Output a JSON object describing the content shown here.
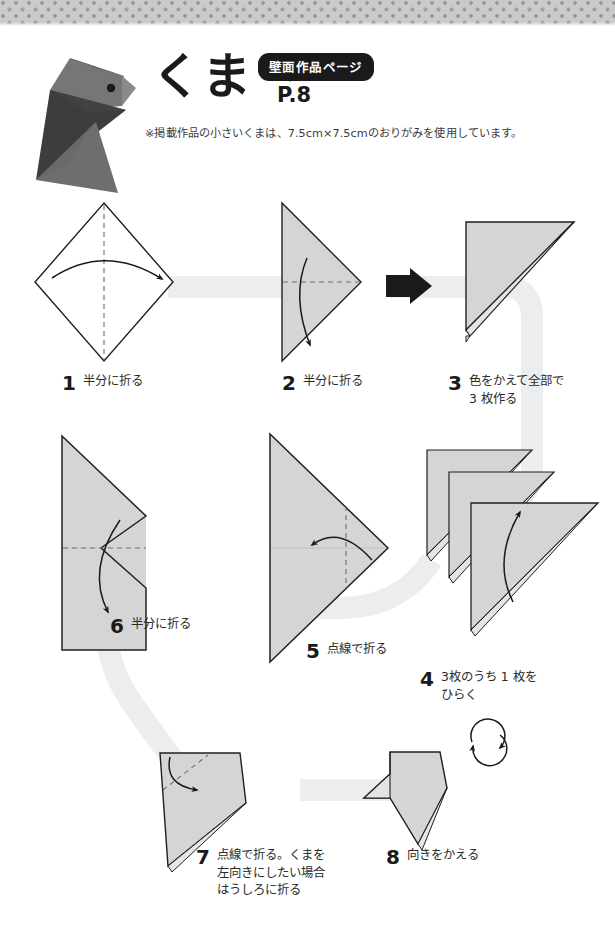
{
  "header": {
    "title": "くま",
    "badge_label": "壁面作品ページ",
    "page_ref": "P.8",
    "note": "※掲載作品の小さいくまは、7.5cm×7.5cmのおりがみを使用しています。",
    "photo_alt": "bear-origami-photo"
  },
  "steps": [
    {
      "num": "1",
      "caption": "半分に折る"
    },
    {
      "num": "2",
      "caption": "半分に折る"
    },
    {
      "num": "3",
      "caption": "色をかえて全部で\n3 枚作る"
    },
    {
      "num": "4",
      "caption": "3枚のうち 1 枚を\nひらく"
    },
    {
      "num": "5",
      "caption": "点線で折る"
    },
    {
      "num": "6",
      "caption": "半分に折る"
    },
    {
      "num": "7",
      "caption": "点線で折る。くまを\n左向きにしたい場合\nはうしろに折る"
    },
    {
      "num": "8",
      "caption": "向きをかえる"
    }
  ],
  "colors": {
    "paper_fill": "#d5d5d5",
    "paper_fill_light": "#e2e2e2",
    "paper_stroke": "#231f20",
    "ribbon": "#eceded",
    "band_dot": "#9a9b9d",
    "band_bg": "#c9cacb",
    "ink": "#1a1a1a",
    "bear_head": "#7a7a7a",
    "bear_body": "#3f3f3f",
    "bear_tail": "#6f6f6f"
  },
  "icons": {
    "fold_arrow": "curved-fold-arrow-icon",
    "transition_arrow": "right-arrow-icon",
    "rotate_arrow": "rotate-arrow-icon",
    "dashed_fold_line": "dashed-fold-line-icon",
    "ribbon": "flow-ribbon-icon"
  }
}
